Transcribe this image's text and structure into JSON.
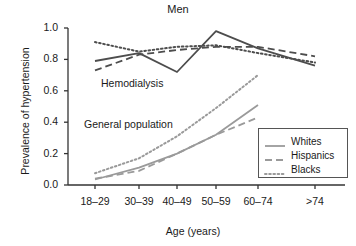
{
  "chart_data": {
    "type": "line",
    "title": "Men",
    "xlabel": "Age (years)",
    "ylabel": "Prevalence of hypertension",
    "categories": [
      "18–29",
      "30–39",
      "40–49",
      "50–59",
      "60–74",
      ">74"
    ],
    "ylim": [
      0.0,
      1.0
    ],
    "yticks": [
      "0.0",
      "0.2",
      "0.4",
      "0.6",
      "0.8",
      "1.0"
    ],
    "ytick_values": [
      0.0,
      0.2,
      0.4,
      0.6,
      0.8,
      1.0
    ],
    "grid": false,
    "legend_position": "bottom-right",
    "legend": [
      {
        "name": "Whites",
        "style": "solid"
      },
      {
        "name": "Hispanics",
        "style": "dashed"
      },
      {
        "name": "Blacks",
        "style": "dotted"
      }
    ],
    "annotations": [
      {
        "text": "Hemodialysis",
        "group": "hemodialysis"
      },
      {
        "text": "General population",
        "group": "general-population"
      }
    ],
    "groups": [
      {
        "name": "Hemodialysis",
        "color": "#4d4d4d",
        "series": [
          {
            "name": "Whites",
            "style": "solid",
            "x": [
              "18–29",
              "30–39",
              "40–49",
              "50–59",
              "60–74",
              ">74"
            ],
            "values": [
              0.79,
              0.84,
              0.72,
              0.98,
              0.87,
              0.76
            ]
          },
          {
            "name": "Hispanics",
            "style": "dashed",
            "x": [
              "18–29",
              "30–39",
              "40–49",
              "50–59",
              "60–74",
              ">74"
            ],
            "values": [
              0.73,
              0.83,
              0.86,
              0.88,
              0.88,
              0.82
            ]
          },
          {
            "name": "Blacks",
            "style": "dotted",
            "x": [
              "18–29",
              "30–39",
              "40–49",
              "50–59",
              "60–74",
              ">74"
            ],
            "values": [
              0.91,
              0.85,
              0.88,
              0.89,
              0.84,
              0.78
            ]
          }
        ]
      },
      {
        "name": "General population",
        "color": "#9a9a9a",
        "series": [
          {
            "name": "Whites",
            "style": "solid",
            "x": [
              "18–29",
              "30–39",
              "40–49",
              "50–59",
              "60–74"
            ],
            "values": [
              0.035,
              0.11,
              0.2,
              0.32,
              0.51
            ]
          },
          {
            "name": "Hispanics",
            "style": "dashed",
            "x": [
              "18–29",
              "30–39",
              "40–49",
              "50–59",
              "60–74"
            ],
            "values": [
              0.04,
              0.09,
              0.2,
              0.32,
              0.43
            ]
          },
          {
            "name": "Blacks",
            "style": "dotted",
            "x": [
              "18–29",
              "30–39",
              "40–49",
              "50–59",
              "60–74"
            ],
            "values": [
              0.075,
              0.17,
              0.31,
              0.49,
              0.7
            ]
          }
        ]
      }
    ]
  },
  "axes": {
    "y_label": "Prevalence of hypertension",
    "x_label": "Age (years)",
    "y_ticks": [
      "1.0",
      "0.8",
      "0.6",
      "0.4",
      "0.2",
      "0.0"
    ],
    "x_ticks": [
      "18–29",
      "30–39",
      "40–49",
      "50–59",
      "60–74",
      ">74"
    ]
  },
  "title": "Men",
  "annotations": {
    "hemodialysis": "Hemodialysis",
    "general_population": "General population"
  },
  "legend": {
    "items": [
      {
        "label": "Whites"
      },
      {
        "label": "Hispanics"
      },
      {
        "label": "Blacks"
      }
    ]
  },
  "colors": {
    "hemodialysis_line": "#4d4d4d",
    "general_population_line": "#9a9a9a",
    "axis": "#333333",
    "text": "#1a1a1a"
  }
}
